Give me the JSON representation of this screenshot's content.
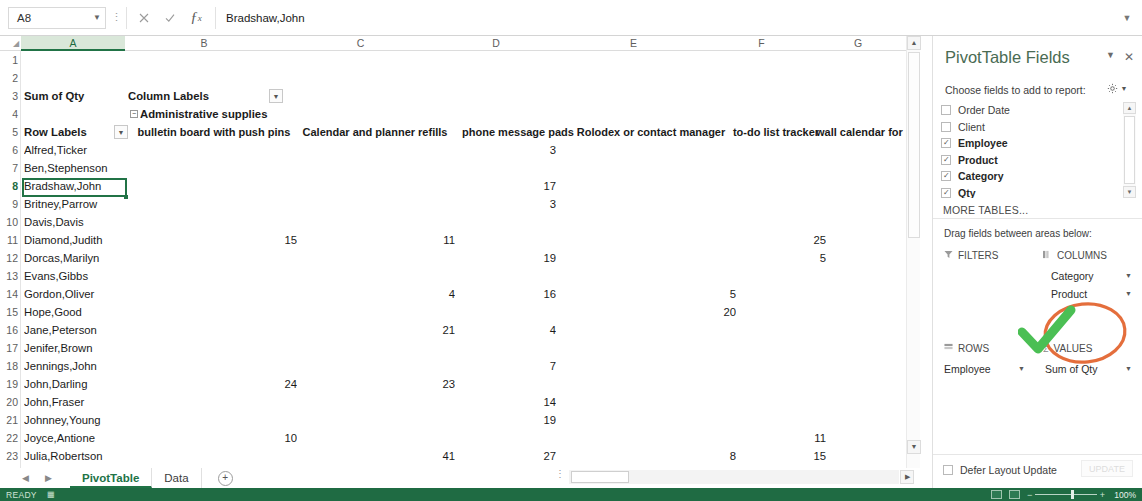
{
  "formula_bar": {
    "name_box": "A8",
    "formula_value": "Bradshaw,John",
    "cancel_icon": "times-icon",
    "confirm_icon": "check-icon",
    "function_icon": "fx-icon",
    "expand_icon": "chevron-down-icon"
  },
  "grid": {
    "columns": [
      "A",
      "B",
      "C",
      "D",
      "E",
      "F",
      "G"
    ],
    "selected_column": "A",
    "selected_row": 8,
    "row_numbers": [
      1,
      2,
      3,
      4,
      5,
      6,
      7,
      8,
      9,
      10,
      11,
      12,
      13,
      14,
      15,
      16,
      17,
      18,
      19,
      20,
      21,
      22,
      23,
      24
    ],
    "pivot": {
      "value_field_caption": "Sum of Qty",
      "column_labels_caption": "Column Labels",
      "category_group": "Administrative supplies",
      "row_labels_caption": "Row Labels",
      "product_headers": [
        "bulletin board with push pins",
        "Calendar and planner refills",
        "phone message pads",
        "Rolodex or contact manager",
        "to-do list tracker",
        "wall calendar for pl"
      ],
      "rows": [
        {
          "row": 6,
          "employee": "Alfred,Ticker",
          "values": [
            "",
            "",
            "3",
            "",
            "",
            ""
          ]
        },
        {
          "row": 7,
          "employee": "Ben,Stephenson",
          "values": [
            "",
            "",
            "",
            "",
            "",
            ""
          ]
        },
        {
          "row": 8,
          "employee": "Bradshaw,John",
          "values": [
            "",
            "",
            "17",
            "",
            "",
            ""
          ]
        },
        {
          "row": 9,
          "employee": "Britney,Parrow",
          "values": [
            "",
            "",
            "3",
            "",
            "",
            ""
          ]
        },
        {
          "row": 10,
          "employee": "Davis,Davis",
          "values": [
            "",
            "",
            "",
            "",
            "",
            ""
          ]
        },
        {
          "row": 11,
          "employee": "Diamond,Judith",
          "values": [
            "15",
            "11",
            "",
            "",
            "25",
            ""
          ]
        },
        {
          "row": 12,
          "employee": "Dorcas,Marilyn",
          "values": [
            "",
            "",
            "19",
            "",
            "5",
            ""
          ]
        },
        {
          "row": 13,
          "employee": "Evans,Gibbs",
          "values": [
            "",
            "",
            "",
            "",
            "",
            ""
          ]
        },
        {
          "row": 14,
          "employee": "Gordon,Oliver",
          "values": [
            "",
            "4",
            "16",
            "5",
            "",
            ""
          ]
        },
        {
          "row": 15,
          "employee": "Hope,Good",
          "values": [
            "",
            "",
            "",
            "20",
            "",
            ""
          ]
        },
        {
          "row": 16,
          "employee": "Jane,Peterson",
          "values": [
            "",
            "21",
            "4",
            "",
            "",
            ""
          ]
        },
        {
          "row": 17,
          "employee": "Jenifer,Brown",
          "values": [
            "",
            "",
            "",
            "",
            "",
            ""
          ]
        },
        {
          "row": 18,
          "employee": "Jennings,John",
          "values": [
            "",
            "",
            "7",
            "",
            "",
            ""
          ]
        },
        {
          "row": 19,
          "employee": "John,Darling",
          "values": [
            "24",
            "23",
            "",
            "",
            "",
            ""
          ]
        },
        {
          "row": 20,
          "employee": "John,Fraser",
          "values": [
            "",
            "",
            "14",
            "",
            "",
            ""
          ]
        },
        {
          "row": 21,
          "employee": "Johnney,Young",
          "values": [
            "",
            "",
            "19",
            "",
            "",
            ""
          ]
        },
        {
          "row": 22,
          "employee": "Joyce,Antione",
          "values": [
            "10",
            "",
            "",
            "",
            "11",
            ""
          ]
        },
        {
          "row": 23,
          "employee": "Julia,Robertson",
          "values": [
            "",
            "41",
            "27",
            "8",
            "15",
            ""
          ]
        },
        {
          "row": 24,
          "employee": "Ken,Morning",
          "values": [
            "",
            "17",
            "",
            "",
            "17",
            ""
          ]
        }
      ]
    }
  },
  "pivot_panel": {
    "title": "PivotTable Fields",
    "collapse_icon": "chevron-down-icon",
    "close_icon": "close-icon",
    "choose_label": "Choose fields to add to report:",
    "gear_icon": "gear-icon",
    "gear_caret": "chevron-down-icon",
    "fields": [
      {
        "label": "Order Date",
        "checked": false
      },
      {
        "label": "Client",
        "checked": false
      },
      {
        "label": "Employee",
        "checked": true
      },
      {
        "label": "Product",
        "checked": true
      },
      {
        "label": "Category",
        "checked": true
      },
      {
        "label": "Qty",
        "checked": true
      },
      {
        "label": "Total",
        "checked": false
      }
    ],
    "more_tables": "MORE TABLES...",
    "drag_label": "Drag fields between areas below:",
    "areas": {
      "filters": {
        "title": "FILTERS",
        "icon": "filter-icon",
        "items": []
      },
      "columns": {
        "title": "COLUMNS",
        "icon": "columns-icon",
        "items": [
          "Category",
          "Product"
        ]
      },
      "rows": {
        "title": "ROWS",
        "icon": "rows-icon",
        "items": [
          "Employee"
        ]
      },
      "values": {
        "title": "VALUES",
        "icon": "sigma-icon",
        "items": [
          "Sum of Qty"
        ]
      }
    },
    "defer_label": "Defer Layout Update",
    "update_label": "UPDATE"
  },
  "annotations": {
    "check_mark": "green-check-annotation",
    "highlight_circle": "orange-ellipse-annotation",
    "check_color": "#4bbf54",
    "circle_color": "#e2622b"
  },
  "sheet_tabs": {
    "prev_icon": "chevron-left-icon",
    "next_icon": "chevron-right-icon",
    "tabs": [
      {
        "label": "PivotTable",
        "active": true
      },
      {
        "label": "Data",
        "active": false
      }
    ],
    "add_icon": "plus-circle-icon"
  },
  "status_bar": {
    "status": "READY",
    "macro_icon": "record-macro-icon",
    "view_normal_icon": "normal-view-icon",
    "view_layout_icon": "page-layout-icon",
    "zoom_out_icon": "minus-icon",
    "zoom_in_icon": "plus-icon",
    "zoom_level": "100%"
  },
  "theme": {
    "excel_green": "#217346",
    "status_green": "#1f6b43",
    "header_text": "#5e5e5e"
  }
}
